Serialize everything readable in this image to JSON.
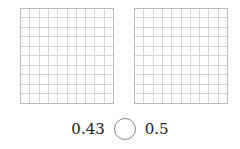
{
  "grids": [
    {
      "rows": 10,
      "cols": 10,
      "shaded": 0
    },
    {
      "rows": 10,
      "cols": 10,
      "shaded": 0
    }
  ],
  "comparison": {
    "left_value": "0.43",
    "symbol_placeholder": "",
    "right_value": "0.5"
  }
}
